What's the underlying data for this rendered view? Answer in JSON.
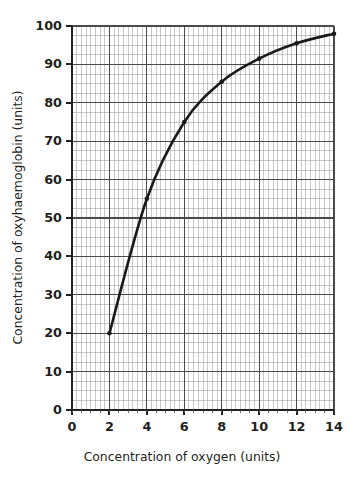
{
  "figure": {
    "background_color": "#ffffff",
    "ink_color": "#231f20"
  },
  "axes": {
    "x_title": "Concentration of oxygen (units)",
    "y_title": "Concentration of oxyhaemoglobin (units)",
    "x_tick_labels": [
      "0",
      "2",
      "4",
      "6",
      "8",
      "10",
      "12",
      "14"
    ],
    "y_tick_labels": [
      "0",
      "10",
      "20",
      "30",
      "40",
      "50",
      "60",
      "70",
      "80",
      "90",
      "100"
    ]
  },
  "chart_data": {
    "type": "line",
    "title": "",
    "subtitle": "",
    "xlabel": "Concentration of oxygen (units)",
    "ylabel": "Concentration of oxyhaemoglobin (units)",
    "xlim": [
      0,
      14
    ],
    "ylim": [
      0,
      100
    ],
    "x_major_tick_interval": 2,
    "y_major_tick_interval": 10,
    "x_minor_tick_interval": 0.25,
    "y_minor_tick_interval": 2.5,
    "grid": "major-and-minor",
    "legend": "none",
    "annotations": [],
    "series": [
      {
        "name": "Oxyhaemoglobin dissociation curve",
        "color": "#1a1a1a",
        "line_width": 2.6,
        "marker": "circle",
        "x": [
          2,
          4,
          6,
          8,
          10,
          12,
          14
        ],
        "values": [
          20,
          55,
          75,
          85.5,
          91.5,
          95.5,
          98
        ]
      }
    ]
  },
  "grid_colors": {
    "minor": "#9a9a9a",
    "major": "#4a4a4a",
    "axis": "#231f20"
  }
}
